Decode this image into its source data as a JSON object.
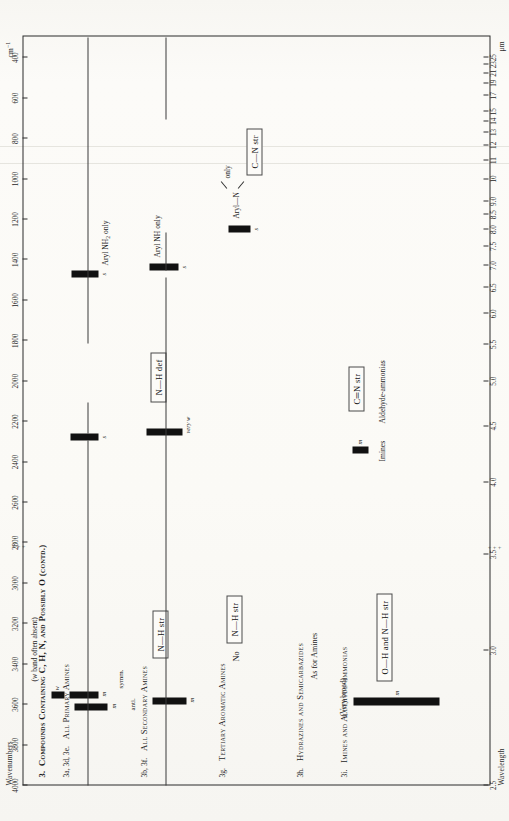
{
  "chart_data": {
    "type": "table",
    "xlabel": "Wavenumbers",
    "xlabel_unit": "cm⁻¹",
    "x2label": "Wavelength",
    "x2label_unit": "μm",
    "wavenumber_ticks": [
      4000,
      3800,
      3600,
      3400,
      3200,
      3000,
      2800,
      2600,
      2400,
      2200,
      2000,
      1800,
      1600,
      1400,
      1200,
      1000,
      800,
      600,
      400
    ],
    "wavelength_ticks": [
      "2.5",
      "3.0",
      "3.5",
      "4.0",
      "4.5",
      "5.0",
      "5.5",
      "6.0",
      "6.5",
      "7.0",
      "7.5",
      "8.0",
      "8.5",
      "9.0",
      "10",
      "11",
      "12",
      "13",
      "14",
      "15",
      "17",
      "19",
      "21",
      "23",
      "25"
    ],
    "rows": [
      {
        "id": "row-primary-amines",
        "label": "3a, 3d, 3e.  All Primary Amines",
        "notes": [
          "(w band often absent)",
          "anti.",
          "symm."
        ],
        "bands": [
          {
            "name": "nh-str-anti",
            "wavenumber_range": [
              3520,
              3380
            ],
            "intensity": "m"
          },
          {
            "name": "nh-str-weak",
            "wavenumber_range": [
              3280,
              3200
            ],
            "intensity": "w"
          },
          {
            "name": "nh-str-symm",
            "wavenumber_range": [
              3440,
              3300
            ],
            "intensity": "m"
          },
          {
            "name": "nh-def",
            "wavenumber_range": [
              1630,
              1590
            ],
            "intensity": "s"
          },
          {
            "name": "c-n-str-aryl",
            "wavenumber_range": [
              1340,
              1290
            ],
            "intensity": "s"
          }
        ]
      },
      {
        "id": "row-secondary-amines",
        "label": "3b, 3f.  All Secondary Amines",
        "notes": [
          "very w"
        ],
        "bands": [
          {
            "name": "nh-str",
            "wavenumber_range": [
              3500,
              3310
            ],
            "intensity": "m"
          },
          {
            "name": "nh-def",
            "wavenumber_range": [
              1620,
              1550
            ],
            "intensity": "very w"
          },
          {
            "name": "c-n-str-aryl-nh",
            "wavenumber_range": [
              1350,
              1280
            ],
            "intensity": "s"
          }
        ]
      },
      {
        "id": "row-tertiary-aromatic-amines",
        "label": "3g.  Tertiary Aromatic Amines",
        "notes": [
          "No  N—H str"
        ],
        "bands": [
          {
            "name": "c-n-str-aryl-n",
            "wavenumber_range": [
              1360,
              1310
            ],
            "intensity": "s"
          }
        ]
      },
      {
        "id": "row-hydrazines",
        "label": "3h.  Hydrazines and Semicarbazides",
        "notes": [
          "As for Amines"
        ],
        "bands": []
      },
      {
        "id": "row-imines",
        "label": "3i.  Imines and Aldehyde-ammonias",
        "notes": [
          "(Very broad)",
          "Imines",
          "Aldehyde-ammonias"
        ],
        "bands": [
          {
            "name": "oh-nh-str-broad",
            "wavenumber_range": [
              3400,
              3050
            ],
            "intensity": "m"
          },
          {
            "name": "c-n-double-str",
            "wavenumber_range": [
              1690,
              1640
            ],
            "intensity": "m"
          }
        ]
      }
    ],
    "assignment_boxes": [
      {
        "name": "nh-str-box",
        "label": "N—H str"
      },
      {
        "name": "no-nh-str-box",
        "label": "No   N—H str"
      },
      {
        "name": "oh-nh-str-box",
        "label": "O—H and N—H str"
      },
      {
        "name": "nh-def-box",
        "label": "N—H def"
      },
      {
        "name": "cn-str-box",
        "label": "C—N str"
      },
      {
        "name": "cn-double-str-box",
        "label": "C═N str"
      }
    ],
    "annotations": [
      "Aryl NH₂ only",
      "Aryl NH only",
      "Aryl—N‹ only"
    ],
    "grid": true,
    "legend": "none"
  },
  "axes": {
    "wavenumbers_title": "Wavenumbers",
    "wavenumbers_unit": "cm",
    "wavenumbers_exp": "−1",
    "wavelength_title": "Wavelength",
    "wavelength_unit": "μm"
  },
  "chart_title": "3.  Compounds Containing C, H, N, and Possibly O (contd.)",
  "rows": {
    "primary": {
      "label_num": "3a, 3d, 3e.",
      "label_name": "All Primary Amines",
      "note_wband": "(w band often absent)",
      "anti": "anti.",
      "symm": "symm.",
      "int_m1": "m",
      "int_w": "w",
      "int_m2": "m",
      "int_s_def": "s",
      "int_s_cn": "s",
      "aryl_nh2": "Aryl NH₂ only"
    },
    "secondary": {
      "label_num": "3b, 3f.",
      "label_name": "All Secondary Amines",
      "int_m": "m",
      "int_veryw": "very w",
      "int_s_cn": "s",
      "aryl_nh": "Aryl NH only"
    },
    "tertiary": {
      "label_num": "3g.",
      "label_name": "Tertiary Aromatic Amines",
      "no_nh": "No",
      "no_nh_str": "N—H str",
      "int_s": "s",
      "aryl_n_only": "only",
      "aryl_n_left": "Aryl—N"
    },
    "hydrazines": {
      "label_num": "3h.",
      "label_name": "Hydrazines and Semicarbazides",
      "note": "As for Amines"
    },
    "imines": {
      "label_num": "3i.",
      "label_name": "Imines and Aldehyde-ammonias",
      "very_broad": "(Very broad)",
      "int_m_broad": "m",
      "int_m_cn": "m",
      "imines": "Imines",
      "aldehyde_ammonias": "Aldehyde-ammonias"
    }
  },
  "boxes": {
    "nh_str": "N—H str",
    "no_nh_str_prefix": "No",
    "no_nh_str": "N—H str",
    "oh_nh_str": "O—H and N—H str",
    "nh_def": "N—H def",
    "cn_str": "C—N str",
    "cn_double_str": "C═N str"
  },
  "ticks": {
    "wavenumbers": [
      "4000",
      "3800",
      "3600",
      "3400",
      "3200",
      "3000",
      "2800",
      "2600",
      "2400",
      "2200",
      "2000",
      "1800",
      "1600",
      "1400",
      "1200",
      "1000",
      "800",
      "600",
      "400"
    ],
    "wavelength": [
      "2.5",
      "3.0",
      "3.5",
      "4.0",
      "4.5",
      "5.0",
      "5.5",
      "6.0",
      "6.5",
      "7.0",
      "7.5",
      "8.0",
      "8.5",
      "9.0",
      "10",
      "11",
      "12",
      "13",
      "14",
      "15",
      "17",
      "19",
      "21",
      "23",
      "25"
    ]
  }
}
